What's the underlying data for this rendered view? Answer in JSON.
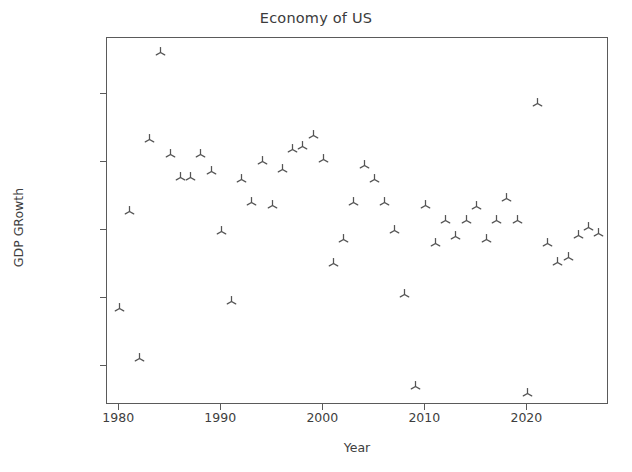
{
  "chart_data": {
    "type": "scatter",
    "title": "Economy of US",
    "xlabel": "Year",
    "ylabel": "GDP GRowth",
    "grid": false,
    "legend": null,
    "marker": "tri-up",
    "marker_color": "#555555",
    "xlim": [
      1978.8,
      1028.0
    ],
    "axis_ranges": {
      "xlim": [
        1978.8,
        2028.0
      ],
      "ylim": [
        -0.0315,
        0.0765
      ]
    },
    "xticks": [
      1980,
      1990,
      2000,
      2010,
      2020
    ],
    "xtick_labels": [
      "1980",
      "1990",
      "2000",
      "2010",
      "2020"
    ],
    "yticks": [
      -0.02,
      0.0,
      0.02,
      0.04,
      0.06
    ],
    "ytick_labels": [
      "−0.02",
      "0.00",
      "0.02",
      "0.04",
      "0.06"
    ],
    "x": [
      1980,
      1981,
      1982,
      1983,
      1984,
      1985,
      1986,
      1987,
      1988,
      1989,
      1990,
      1991,
      1992,
      1993,
      1994,
      1995,
      1996,
      1997,
      1998,
      1999,
      2000,
      2001,
      2002,
      2003,
      2004,
      2005,
      2006,
      2007,
      2008,
      2009,
      2010,
      2011,
      2012,
      2013,
      2014,
      2015,
      2016,
      2017,
      2018,
      2019,
      2020,
      2021,
      2022,
      2023,
      2024,
      2025,
      2026,
      2027
    ],
    "y": [
      -0.003,
      0.0255,
      -0.0178,
      0.0465,
      0.0721,
      0.0421,
      0.0355,
      0.0355,
      0.0421,
      0.0373,
      0.0195,
      -0.001,
      0.0349,
      0.0282,
      0.0401,
      0.0271,
      0.0379,
      0.0438,
      0.0446,
      0.0479,
      0.0408,
      0.0102,
      0.0173,
      0.0282,
      0.0391,
      0.0349,
      0.0282,
      0.0199,
      0.0011,
      -0.0262,
      0.0271,
      0.0161,
      0.0229,
      0.018,
      0.0229,
      0.0268,
      0.0172,
      0.0229,
      0.0294,
      0.0229,
      -0.0281,
      0.0571,
      0.0161,
      0.0104,
      0.0119,
      0.0184,
      0.0208,
      0.019
    ],
    "series_label": "GDP Growth"
  },
  "axes": {
    "title": "Economy of US",
    "xlabel": "Year",
    "ylabel": "GDP GRowth",
    "xtick_labels": [
      "1980",
      "1990",
      "2000",
      "2010",
      "2020"
    ],
    "ytick_labels": [
      "−0.02",
      "0.00",
      "0.02",
      "0.04",
      "0.06"
    ]
  },
  "style": {
    "background": "#ffffff",
    "axis_color": "#5a5a5a",
    "text_color": "#3e3e3e",
    "marker_color": "#555555"
  }
}
